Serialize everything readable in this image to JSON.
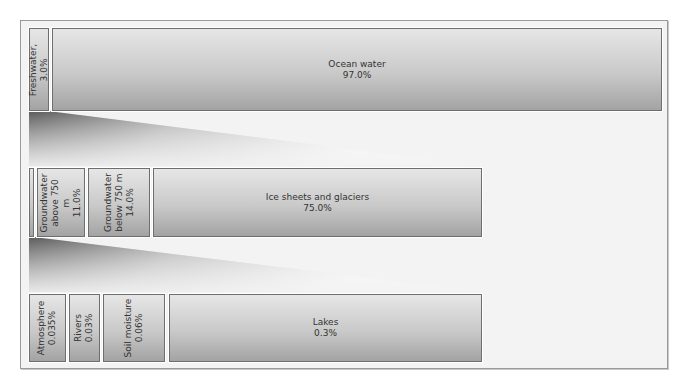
{
  "diagram": {
    "title": "",
    "rows": [
      {
        "name": "total-water",
        "items": [
          {
            "label": "Freshwater, 3.0%",
            "orientation": "vertical"
          },
          {
            "label": "Ocean water\n97.0%",
            "orientation": "horizontal"
          }
        ]
      },
      {
        "name": "freshwater",
        "items": [
          {
            "label": "",
            "orientation": "vertical"
          },
          {
            "label": "Groundwater\nabove 750 m\n11.0%",
            "orientation": "vertical"
          },
          {
            "label": "Groundwater\nbelow 750 m\n14.0%",
            "orientation": "vertical"
          },
          {
            "label": "Ice sheets and glaciers\n75.0%",
            "orientation": "horizontal"
          }
        ]
      },
      {
        "name": "surface-freshwater",
        "items": [
          {
            "label": "Atmosphere\n0.035%",
            "orientation": "vertical"
          },
          {
            "label": "Rivers\n0.03%",
            "orientation": "vertical"
          },
          {
            "label": "Soil moisture\n0.06%",
            "orientation": "vertical"
          },
          {
            "label": "Lakes\n0.3%",
            "orientation": "horizontal"
          }
        ]
      }
    ]
  },
  "colors": {
    "frame_bg": "#f3f3f3",
    "box_top": "#e6e6e6",
    "box_bottom": "#a3a3a3",
    "border": "#6e6e6e",
    "text": "#333333"
  }
}
